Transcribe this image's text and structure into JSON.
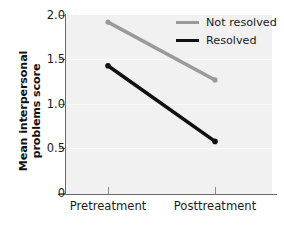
{
  "chart_data": {
    "type": "line",
    "title": "",
    "xlabel": "",
    "ylabel": "Mean interpersonal problems score",
    "ylabel_line1": "Mean interpersonal",
    "ylabel_line2": "problems score",
    "categories": [
      "Pretreatment",
      "Posttreatment"
    ],
    "ylim": [
      0,
      2.0
    ],
    "yticks": [
      0,
      0.5,
      1.0,
      1.5,
      2.0
    ],
    "ytick_labels": [
      "0",
      "0.5",
      "1.0",
      "1.5",
      "2.0"
    ],
    "grid": true,
    "grid_color": "#fafafa",
    "plot_background": "#f1f1f1",
    "legend_position": "top-right",
    "series": [
      {
        "name": "Not resolved",
        "color": "#9a9a9a",
        "values": [
          1.92,
          1.27
        ],
        "markers": true
      },
      {
        "name": "Resolved",
        "color": "#111111",
        "values": [
          1.43,
          0.58
        ],
        "markers": true
      }
    ]
  },
  "axes": {
    "ytick_0": "0",
    "ytick_1": "0.5",
    "ytick_2": "1.0",
    "ytick_3": "1.5",
    "ytick_4": "2.0",
    "xtick_0": "Pretreatment",
    "xtick_1": "Posttreatment"
  },
  "legend": {
    "items": [
      {
        "label": "Not resolved",
        "color": "#9a9a9a"
      },
      {
        "label": "Resolved",
        "color": "#111111"
      }
    ]
  }
}
